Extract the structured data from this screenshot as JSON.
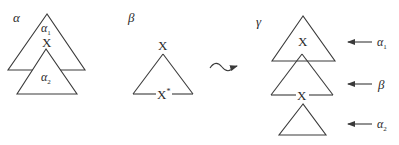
{
  "panels": {
    "alpha": {
      "title": "α",
      "upper_tree_label": "α",
      "upper_tree_sub": "1",
      "node_label": "X",
      "lower_tree_label": "α",
      "lower_tree_sub": "2"
    },
    "beta": {
      "title": "β",
      "root_label": "X",
      "foot_label": "X",
      "foot_mark": "*"
    },
    "gamma": {
      "title": "γ",
      "top_node_label": "X",
      "middle_node_label": "X",
      "arrow_labels": [
        {
          "label": "α",
          "sub": "1"
        },
        {
          "label": "β",
          "sub": ""
        },
        {
          "label": "α",
          "sub": "2"
        }
      ]
    }
  },
  "connector": {
    "type": "squiggle-arrow",
    "meaning": "derives"
  }
}
